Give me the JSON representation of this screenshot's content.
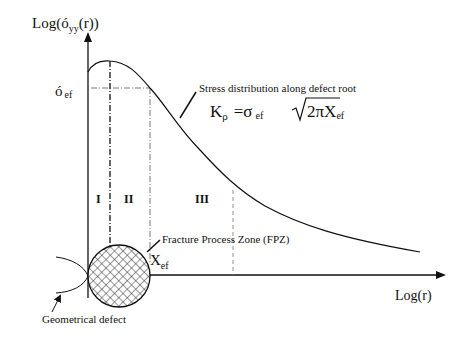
{
  "axes": {
    "y_label": "Log(ó",
    "y_label_sub": "yy",
    "y_label_tail": "(r))",
    "x_label": "Log(r)"
  },
  "sigma_ef": {
    "main": "ó",
    "sub": "ef"
  },
  "curve_annotation": "Stress distribution along defect root",
  "formula": {
    "k": "K",
    "k_sub": "ρ",
    "eq": "=σ",
    "sigma_sub": "ef",
    "sqrt_body": "2πX",
    "x_sub": "ef"
  },
  "zones": [
    "I",
    "II",
    "III"
  ],
  "fpz_label": "Fracture Process Zone (FPZ)",
  "x_ef": {
    "main": "X",
    "sub": "ef"
  },
  "defect_label": "Geometrical defect"
}
